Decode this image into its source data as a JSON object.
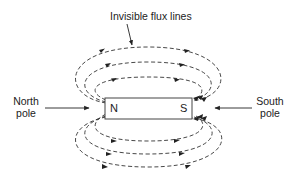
{
  "diagram": {
    "title_label": "Invisible flux lines",
    "left_label": {
      "line1": "North",
      "line2": "pole"
    },
    "right_label": {
      "line1": "South",
      "line2": "pole"
    },
    "magnet": {
      "north_letter": "N",
      "south_letter": "S"
    },
    "colors": {
      "stroke": "#333333",
      "text": "#222222",
      "background": "#ffffff"
    }
  }
}
